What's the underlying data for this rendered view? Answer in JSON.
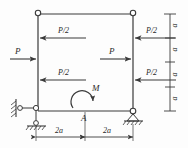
{
  "figure": {
    "type": "structural-frame-diagram",
    "stroke_color": "#3a3a3a",
    "text_color": "#2b2b2b",
    "background": "#fdfdfd"
  },
  "loads": {
    "left_upper_half": "P/2",
    "left_force": "P",
    "left_lower_half": "P/2",
    "right_upper_half": "P/2",
    "mid_force": "P",
    "right_lower_half": "P/2",
    "moment": "M"
  },
  "points": {
    "base_mid": "A"
  },
  "dimensions": {
    "bottom": [
      "2a",
      "2a"
    ],
    "right": [
      "a",
      "a",
      "a",
      "a"
    ]
  },
  "icons": {
    "hinge": "hinge-circle",
    "pin_support": "pin-support-triangle",
    "roller_support": "roller-support",
    "ground_hatch": "ground-hatching",
    "moment_arrow": "curved-moment-arrow"
  }
}
